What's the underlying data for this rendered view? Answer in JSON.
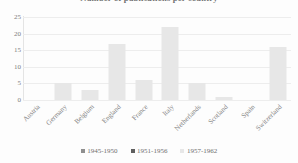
{
  "chart_data": {
    "type": "bar",
    "title": "Number of publications per country",
    "xlabel": "",
    "ylabel": "",
    "categories": [
      "Austria",
      "Germany",
      "Belgium",
      "England",
      "France",
      "Italy",
      "Netherlands",
      "Scotland",
      "Spain",
      "Switzerland"
    ],
    "series": [
      {
        "name": "1945-1950",
        "color": "#8f8f8f",
        "values": [
          0,
          0,
          0,
          0,
          0,
          0,
          0,
          0,
          0,
          0
        ]
      },
      {
        "name": "1951-1956",
        "color": "#5f5f5f",
        "values": [
          0,
          0,
          0,
          0,
          0,
          0,
          0,
          0,
          0,
          0
        ]
      },
      {
        "name": "1957-1962",
        "color": "#e7e7e7",
        "values": [
          0,
          5,
          3,
          17,
          6,
          22,
          5,
          1,
          0,
          16
        ]
      }
    ],
    "ylim": [
      0,
      25
    ],
    "yticks": [
      0,
      5,
      10,
      15,
      20,
      25
    ],
    "ytick_labels": [
      "0",
      "5",
      "10",
      "15",
      "20",
      "25"
    ],
    "grid": true,
    "legend_position": "bottom"
  },
  "legend": {
    "items": [
      {
        "label": "1945-1950",
        "color": "#8f8f8f"
      },
      {
        "label": "1951-1956",
        "color": "#5f5f5f"
      },
      {
        "label": "1957-1962",
        "color": "#e7e7e7"
      }
    ]
  }
}
